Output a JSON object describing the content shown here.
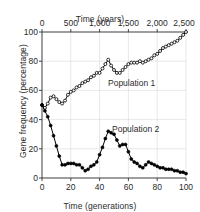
{
  "chart_data": {
    "type": "line",
    "title": "",
    "xlabel": "Time (generations)",
    "ylabel": "Gene frequency (percentage)",
    "x2label": "Time (years)",
    "xlim": [
      0,
      100
    ],
    "ylim": [
      0,
      100
    ],
    "x2lim": [
      0,
      2500
    ],
    "grid": true,
    "legend_position": "inline-annotation",
    "xticks": [
      "0",
      "20",
      "40",
      "60",
      "80",
      "100"
    ],
    "xtick_values": [
      0,
      20,
      40,
      60,
      80,
      100
    ],
    "yticks": [
      "0",
      "20",
      "40",
      "60",
      "80",
      "100"
    ],
    "ytick_values": [
      0,
      20,
      40,
      60,
      80,
      100
    ],
    "x2ticks": [
      "0",
      "500",
      "1,000",
      "1,500",
      "2,000",
      "2,500"
    ],
    "x2tick_values": [
      0,
      500,
      1000,
      1500,
      2000,
      2500
    ],
    "series": [
      {
        "name": "Population 1",
        "marker": "open-circle",
        "color": "#000000",
        "x": [
          0,
          2,
          4,
          6,
          8,
          10,
          12,
          14,
          16,
          18,
          20,
          22,
          24,
          26,
          28,
          30,
          32,
          34,
          36,
          38,
          40,
          42,
          44,
          46,
          48,
          50,
          52,
          54,
          56,
          58,
          60,
          62,
          64,
          66,
          68,
          70,
          72,
          74,
          76,
          78,
          80,
          82,
          84,
          86,
          88,
          90,
          92,
          94,
          96,
          98,
          100
        ],
        "values": [
          50,
          48,
          51,
          55,
          56,
          54,
          52,
          51,
          53,
          57,
          59,
          60,
          62,
          63,
          65,
          66,
          67,
          69,
          70,
          72,
          72,
          75,
          78,
          81,
          77,
          74,
          72,
          72,
          74,
          76,
          78,
          79,
          79,
          79,
          80,
          79,
          80,
          81,
          82,
          84,
          85,
          87,
          89,
          90,
          91,
          92,
          93,
          94,
          96,
          98,
          100
        ]
      },
      {
        "name": "Population 2",
        "marker": "filled-circle",
        "color": "#000000",
        "x": [
          0,
          2,
          4,
          6,
          8,
          10,
          12,
          14,
          16,
          18,
          20,
          22,
          24,
          26,
          28,
          30,
          32,
          34,
          36,
          38,
          40,
          42,
          44,
          46,
          48,
          50,
          52,
          54,
          56,
          58,
          60,
          62,
          64,
          66,
          68,
          70,
          72,
          74,
          76,
          78,
          80,
          82,
          84,
          86,
          88,
          90,
          92,
          94,
          96,
          98,
          100
        ],
        "values": [
          50,
          46,
          42,
          36,
          29,
          22,
          15,
          9,
          9,
          10,
          10,
          10,
          9,
          9,
          7,
          5,
          6,
          8,
          9,
          11,
          16,
          21,
          27,
          32,
          31,
          30,
          26,
          22,
          23,
          23,
          18,
          13,
          11,
          10,
          8,
          7,
          9,
          11,
          10,
          9,
          8,
          7,
          7,
          6,
          6,
          6,
          5,
          5,
          4,
          4,
          3
        ]
      }
    ]
  },
  "annotations": [
    {
      "name": "Population 1",
      "text": "Population 1"
    },
    {
      "name": "Population 2",
      "text": "Population 2"
    }
  ]
}
